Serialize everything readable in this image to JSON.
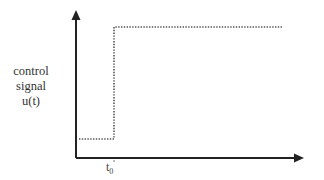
{
  "diagram": {
    "type": "step-function",
    "y_axis_label": [
      "control",
      "signal",
      "u(t)"
    ],
    "x_tick": {
      "main": "t",
      "subscript": "0"
    },
    "signal": {
      "style": "dotted",
      "low_level_before_t0": true,
      "high_level_after_t0": true
    },
    "colors": {
      "axis": "#222222",
      "signal": "#555555",
      "text": "#333333",
      "background": "#ffffff"
    }
  }
}
